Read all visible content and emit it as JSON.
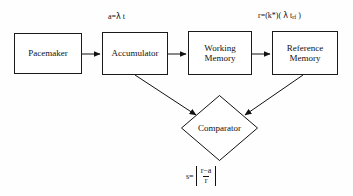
{
  "diagram": {
    "background_color": "#fefefe",
    "stroke_color": "#111111",
    "nodes": {
      "pacemaker": {
        "label": "Pacemaker",
        "shape": "rectangle"
      },
      "accumulator": {
        "label": "Accumulator",
        "shape": "rectangle"
      },
      "working_memory": {
        "label": "Working\nMemory",
        "shape": "rectangle"
      },
      "reference_memory": {
        "label": "Reference\nMemory",
        "shape": "rectangle"
      },
      "comparator": {
        "label": "Comparator",
        "shape": "diamond"
      }
    },
    "equations": {
      "accumulator": {
        "lhs": "a=",
        "lambda": "λ",
        "rhs": " t",
        "full": "a=λ t"
      },
      "reference": {
        "prefix": "r=(k*)( ",
        "lambda": "λ",
        "variable": " t",
        "subscript": "rf",
        "suffix": " )",
        "full": "r=(k*)( λ t_rf )"
      },
      "comparator": {
        "lhs": "s=",
        "numerator": "r−a",
        "denominator": "r",
        "full": "s=|(r−a)/r|"
      }
    },
    "edges": [
      {
        "from": "pacemaker",
        "to": "accumulator",
        "style": "arrow-right"
      },
      {
        "from": "accumulator",
        "to": "working_memory",
        "style": "arrow-right"
      },
      {
        "from": "working_memory",
        "to": "reference_memory",
        "style": "arrow-right"
      },
      {
        "from": "accumulator",
        "to": "comparator",
        "style": "arrow-diagonal-down-right"
      },
      {
        "from": "reference_memory",
        "to": "comparator",
        "style": "arrow-diagonal-down-left"
      }
    ]
  }
}
